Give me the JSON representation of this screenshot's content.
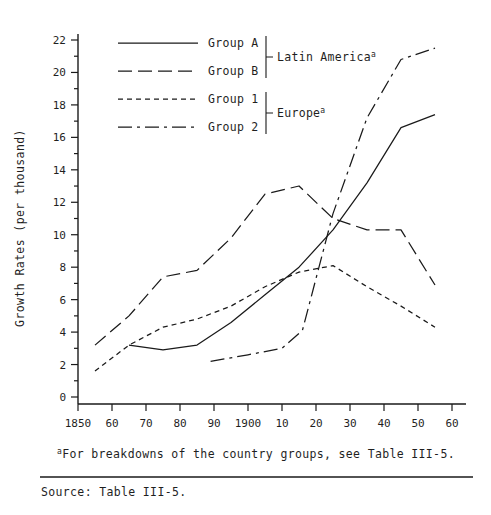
{
  "figure": {
    "ylabel": "Growth Rates (per thousand)",
    "footnote": "For breakdowns of the country groups, see Table III-5.",
    "footnote_marker": "a",
    "source": "Source:  Table III-5.",
    "region_labels": [
      {
        "text": "Latin America",
        "sup": "a"
      },
      {
        "text": "Europe",
        "sup": "a"
      }
    ]
  },
  "legend": {
    "entries": [
      {
        "label": "Group A",
        "dash": "none",
        "region": "Latin America"
      },
      {
        "label": "Group B",
        "dash": "long",
        "region": "Latin America"
      },
      {
        "label": "Group 1",
        "dash": "short",
        "region": "Europe"
      },
      {
        "label": "Group 2",
        "dash": "dashdot",
        "region": "Europe"
      }
    ]
  },
  "chart_data": {
    "type": "line",
    "title": "",
    "xlabel": "",
    "ylabel": "Growth Rates (per thousand)",
    "xlim": [
      1850,
      1965
    ],
    "ylim": [
      0,
      22
    ],
    "grid": false,
    "legend_position": "top-left",
    "xticks": [
      1850,
      1860,
      1870,
      1880,
      1890,
      1900,
      1910,
      1920,
      1930,
      1940,
      1950,
      1960
    ],
    "xticklabels": [
      "1850",
      "60",
      "70",
      "80",
      "90",
      "1900",
      "10",
      "20",
      "30",
      "40",
      "50",
      "60"
    ],
    "yticks": [
      0,
      2,
      4,
      6,
      8,
      10,
      12,
      14,
      16,
      18,
      20,
      22
    ],
    "yticklabels": [
      "0",
      "2",
      "4",
      "6",
      "8",
      "10",
      "12",
      "14",
      "16",
      "18",
      "20",
      "22"
    ],
    "yminor_ticks": [
      1,
      3,
      5,
      7,
      9,
      11,
      13,
      15,
      17,
      19,
      21
    ],
    "series": [
      {
        "name": "Group A",
        "region": "Latin America",
        "dash": "none",
        "x": [
          1865,
          1875,
          1885,
          1895,
          1905,
          1915,
          1925,
          1935,
          1945,
          1955
        ],
        "values": [
          3.2,
          2.9,
          3.2,
          4.6,
          6.3,
          8.0,
          10.3,
          13.2,
          16.6,
          17.4
        ]
      },
      {
        "name": "Group B",
        "region": "Latin America",
        "dash": "long",
        "x": [
          1855,
          1865,
          1875,
          1885,
          1895,
          1905,
          1915,
          1925,
          1935,
          1945,
          1955
        ],
        "values": [
          3.2,
          5.0,
          7.4,
          7.8,
          9.8,
          12.5,
          13.0,
          11.0,
          10.3,
          10.3,
          6.9
        ]
      },
      {
        "name": "Group 1",
        "region": "Europe",
        "dash": "short",
        "x": [
          1855,
          1865,
          1875,
          1885,
          1895,
          1905,
          1915,
          1925,
          1935,
          1945,
          1955
        ],
        "values": [
          1.6,
          3.2,
          4.3,
          4.8,
          5.6,
          6.8,
          7.7,
          8.1,
          6.8,
          5.6,
          4.3
        ]
      },
      {
        "name": "Group 2",
        "region": "Europe",
        "dash": "dashdot",
        "x": [
          1889,
          1900,
          1910,
          1916,
          1925,
          1935,
          1945,
          1955
        ],
        "values": [
          2.2,
          2.6,
          3.0,
          4.1,
          11.3,
          17.2,
          20.8,
          21.5
        ]
      }
    ]
  }
}
